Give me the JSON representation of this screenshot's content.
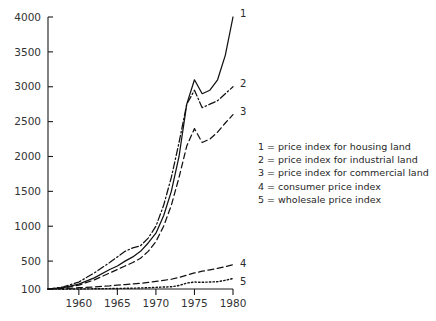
{
  "chart_data": {
    "type": "line",
    "title": "",
    "xlabel": "",
    "ylabel": "",
    "xlim": [
      1956,
      1980
    ],
    "ylim": [
      100,
      4000
    ],
    "grid": false,
    "legend_position": "right-middle",
    "yticks": [
      100,
      500,
      1000,
      1500,
      2000,
      2500,
      3000,
      3500,
      4000
    ],
    "ytick_labels": [
      "100",
      "500",
      "1000",
      "1500",
      "2000",
      "2500",
      "3000",
      "3500",
      "4000"
    ],
    "xticks": [
      1960,
      1965,
      1970,
      1975,
      1980
    ],
    "xtick_labels": [
      "1960",
      "1965",
      "1970",
      "1975",
      "1980"
    ],
    "x": [
      1956,
      1958,
      1960,
      1962,
      1964,
      1965,
      1966,
      1967,
      1968,
      1969,
      1970,
      1971,
      1972,
      1973,
      1974,
      1975,
      1976,
      1977,
      1978,
      1979,
      1980
    ],
    "series": [
      {
        "name": "1",
        "label": "price index for housing land",
        "style": "solid",
        "end_label": "1",
        "values": [
          100,
          120,
          170,
          260,
          380,
          430,
          500,
          560,
          640,
          760,
          900,
          1150,
          1500,
          2000,
          2750,
          3100,
          2900,
          2950,
          3100,
          3450,
          4000
        ]
      },
      {
        "name": "2",
        "label": "price index for industrial land",
        "style": "dash-dot",
        "end_label": "2",
        "values": [
          100,
          130,
          200,
          330,
          480,
          560,
          640,
          690,
          720,
          830,
          1000,
          1300,
          1700,
          2200,
          2750,
          2950,
          2700,
          2750,
          2800,
          2900,
          3000
        ]
      },
      {
        "name": "3",
        "label": "price index for commercial land",
        "style": "dashed",
        "end_label": "3",
        "values": [
          100,
          115,
          155,
          230,
          330,
          380,
          430,
          480,
          540,
          640,
          780,
          1000,
          1300,
          1700,
          2150,
          2400,
          2200,
          2250,
          2350,
          2480,
          2600
        ]
      },
      {
        "name": "4",
        "label": "consumer price index",
        "style": "dashed",
        "end_label": "4",
        "values": [
          100,
          108,
          118,
          130,
          145,
          155,
          163,
          172,
          182,
          195,
          210,
          225,
          240,
          265,
          300,
          330,
          355,
          375,
          395,
          420,
          450
        ]
      },
      {
        "name": "5",
        "label": "wholesale price index",
        "style": "dotted",
        "end_label": "5",
        "values": [
          100,
          97,
          100,
          103,
          106,
          108,
          110,
          112,
          115,
          119,
          124,
          128,
          132,
          150,
          185,
          200,
          196,
          200,
          205,
          225,
          250
        ]
      }
    ],
    "legend_entries": [
      "1 = price index for housing land",
      "2 = price index for industrial land",
      "3 = price index for commercial land",
      "4 = consumer price index",
      "5 = wholesale price index"
    ],
    "colors": {
      "axis": "#1a1a1a",
      "curve": "#111111",
      "background": "#ffffff",
      "text": "#262626"
    }
  }
}
